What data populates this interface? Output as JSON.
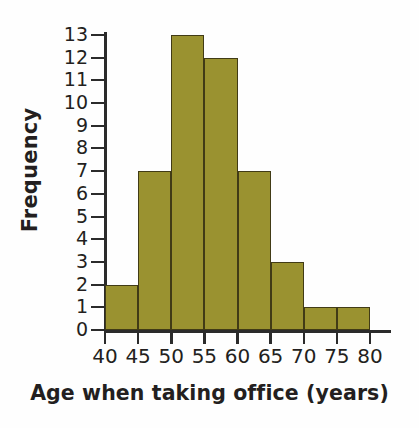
{
  "chart_data": {
    "type": "bar",
    "title": "",
    "subtitle": "",
    "xlabel": "Age when taking office (years)",
    "ylabel": "Frequency",
    "bin_width": 5,
    "bin_edges": [
      40,
      45,
      50,
      55,
      60,
      65,
      70,
      75,
      80
    ],
    "categories": [
      "40-45",
      "45-50",
      "50-55",
      "55-60",
      "60-65",
      "65-70",
      "70-75",
      "75-80"
    ],
    "values": [
      2,
      7,
      13,
      12,
      7,
      3,
      1,
      1
    ],
    "xlim": [
      40,
      80
    ],
    "ylim": [
      0,
      13
    ],
    "xticks": [
      "40",
      "45",
      "50",
      "55",
      "60",
      "65",
      "70",
      "75",
      "80"
    ],
    "yticks": [
      "13",
      "12",
      "11",
      "10",
      "9",
      "8",
      "7",
      "6",
      "5",
      "4",
      "3",
      "2",
      "1",
      "0"
    ],
    "grid": false,
    "legend": null,
    "bar_color": "#9a9230",
    "bar_edge_color": "#413b16",
    "axis_color": "#2b2b2b",
    "text_color": "#231f20",
    "background": "#ffffff"
  }
}
